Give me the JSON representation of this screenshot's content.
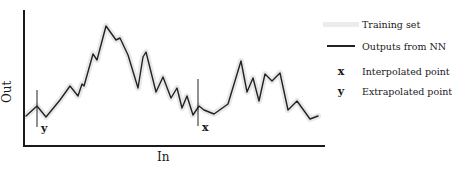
{
  "figure": {
    "axes": {
      "x_label": "In",
      "y_label": "Out"
    },
    "markers": {
      "interpolated": {
        "glyph": "x",
        "x": 201
      },
      "extrapolated": {
        "glyph": "y",
        "x": 37
      }
    },
    "legend": {
      "items": [
        {
          "key": "band",
          "label": "Training set"
        },
        {
          "key": "line",
          "label": "Outputs from NN"
        },
        {
          "key": "x",
          "label": "Interpolated point"
        },
        {
          "key": "y",
          "label": "Extrapolated point"
        }
      ]
    },
    "colors": {
      "curve": "#222222",
      "training_band": "#e8e8e8",
      "axes": "#1a1a1a"
    }
  },
  "chart_data": {
    "type": "line",
    "title": "",
    "xlabel": "In",
    "ylabel": "Out",
    "grid": false,
    "legend_position": "right",
    "series": [
      {
        "name": "Outputs from NN",
        "points_px": [
          [
            26,
            116
          ],
          [
            37,
            106
          ],
          [
            46,
            117
          ],
          [
            60,
            100
          ],
          [
            70,
            86
          ],
          [
            78,
            96
          ],
          [
            82,
            84
          ],
          [
            84,
            86
          ],
          [
            93,
            54
          ],
          [
            97,
            60
          ],
          [
            106,
            26
          ],
          [
            116,
            40
          ],
          [
            120,
            38
          ],
          [
            128,
            55
          ],
          [
            138,
            88
          ],
          [
            143,
            57
          ],
          [
            146,
            52
          ],
          [
            156,
            92
          ],
          [
            163,
            77
          ],
          [
            171,
            98
          ],
          [
            177,
            88
          ],
          [
            182,
            108
          ],
          [
            187,
            96
          ],
          [
            193,
            115
          ],
          [
            199,
            106
          ],
          [
            204,
            110
          ],
          [
            214,
            114
          ],
          [
            228,
            104
          ],
          [
            241,
            61
          ],
          [
            247,
            92
          ],
          [
            253,
            78
          ],
          [
            259,
            101
          ],
          [
            265,
            74
          ],
          [
            272,
            81
          ],
          [
            280,
            73
          ],
          [
            288,
            110
          ],
          [
            297,
            101
          ],
          [
            310,
            119
          ],
          [
            318,
            116
          ]
        ]
      },
      {
        "name": "Training set",
        "style": "light grey band along curve"
      }
    ],
    "annotations": [
      {
        "label": "x",
        "meaning": "Interpolated point",
        "x_px": 201
      },
      {
        "label": "y",
        "meaning": "Extrapolated point",
        "x_px": 37
      }
    ]
  }
}
